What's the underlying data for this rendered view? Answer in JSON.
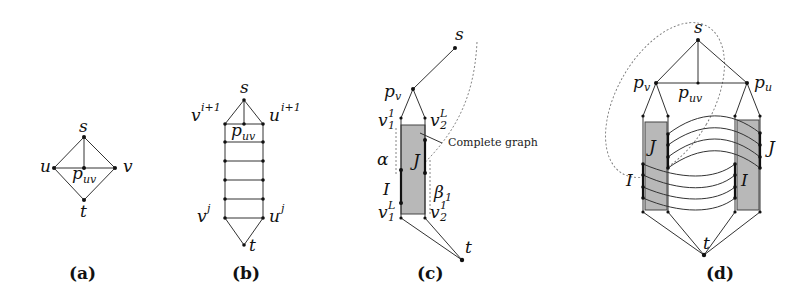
{
  "figure": {
    "panels": [
      {
        "id": "a",
        "caption": "(a)",
        "nodes": {
          "s": "s",
          "u": "u",
          "v": "v",
          "t": "t",
          "p": "p",
          "p_sub": "uv"
        }
      },
      {
        "id": "b",
        "caption": "(b)",
        "nodes": {
          "s": "s",
          "v_top": "v",
          "v_top_sup": "i+1",
          "u_top": "u",
          "u_top_sup": "i+1",
          "p": "p",
          "p_sub": "uv",
          "v_bot": "v",
          "v_bot_sup": "j",
          "u_bot": "u",
          "u_bot_sup": "j",
          "t": "t"
        },
        "rungs": 6
      },
      {
        "id": "c",
        "caption": "(c)",
        "nodes": {
          "s": "s",
          "pv": "p",
          "pv_sub": "v",
          "v11": "v",
          "v11_sub": "1",
          "v11_sup": "1",
          "v2L": "v",
          "v2L_sub": "2",
          "v2L_sup": "L",
          "alpha": "α",
          "J": "J",
          "I": "I",
          "beta": "β",
          "beta_sub": "1",
          "v1L": "v",
          "v1L_sub": "1",
          "v1L_sup": "L",
          "v21": "v",
          "v21_sub": "2",
          "v21_sup": "1",
          "t": "t"
        },
        "annotation": "Complete graph"
      },
      {
        "id": "d",
        "caption": "(d)",
        "nodes": {
          "s": "s",
          "pv": "p",
          "pv_sub": "v",
          "pu": "p",
          "pu_sub": "u",
          "puv": "p",
          "puv_sub": "uv",
          "J_left": "J",
          "I_left": "I",
          "J_right": "J",
          "I_right": "I",
          "t": "t"
        }
      }
    ]
  }
}
